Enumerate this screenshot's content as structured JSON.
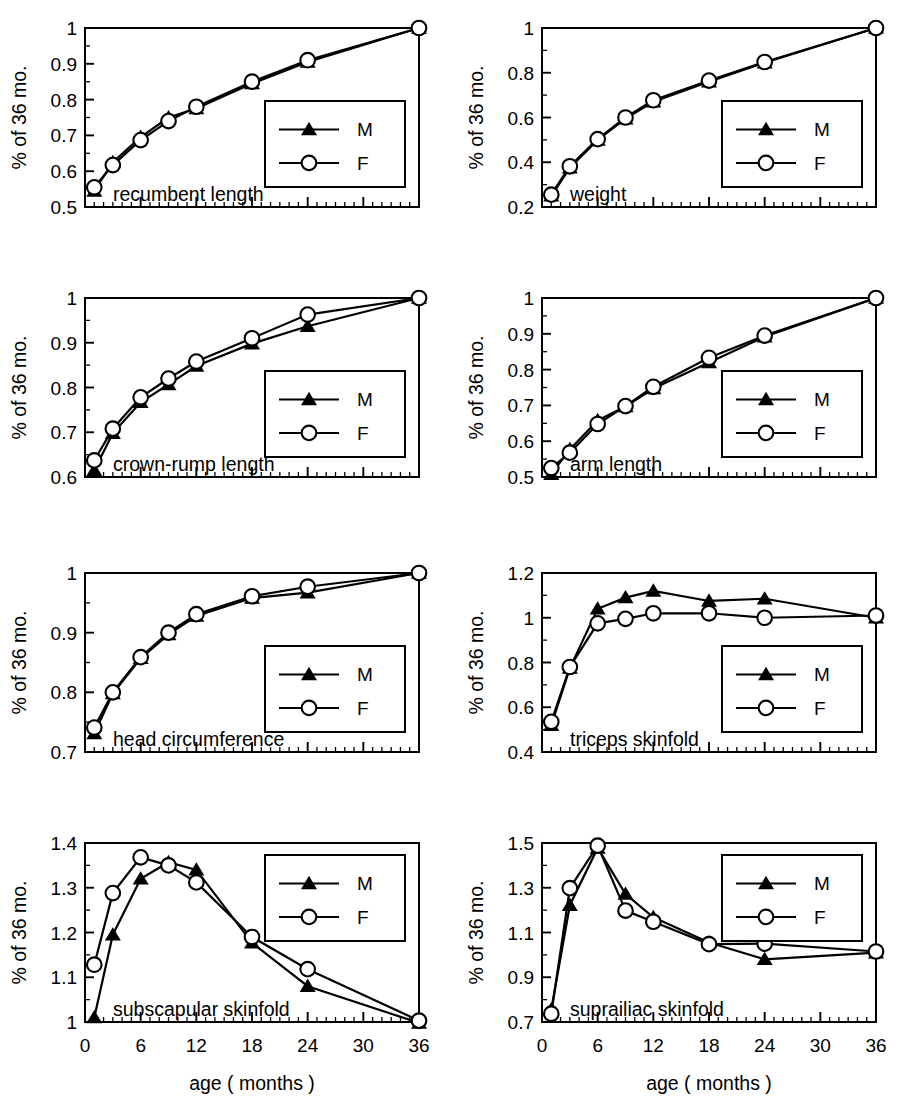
{
  "figure": {
    "axis_titles": {
      "y": "% of 36 mo.",
      "x": "age ( months )"
    },
    "legend": {
      "male_label": "M",
      "female_label": "F",
      "male_marker": "filled-triangle",
      "female_marker": "open-circle"
    },
    "x_tick_labels": [
      "0",
      "6",
      "12",
      "18",
      "24",
      "30",
      "36"
    ],
    "line_color": "#000000"
  },
  "chart_data": [
    {
      "type": "line",
      "title": "recumbent length",
      "xlabel": "age ( months )",
      "ylabel": "% of 36 mo.",
      "x": [
        1,
        3,
        6,
        9,
        12,
        18,
        24,
        36
      ],
      "xlim": [
        0,
        36
      ],
      "ylim": [
        0.5,
        1.0
      ],
      "y_ticks": [
        0.5,
        0.6,
        0.7,
        0.8,
        0.9,
        1.0
      ],
      "y_tick_labels": [
        "0.5",
        "0.6",
        "0.7",
        "0.8",
        "0.9",
        "1"
      ],
      "grid": false,
      "legend_position": "lower-right",
      "series": [
        {
          "name": "M",
          "values": [
            0.545,
            0.625,
            0.695,
            0.75,
            0.775,
            0.845,
            0.905,
            1.0
          ]
        },
        {
          "name": "F",
          "values": [
            0.555,
            0.617,
            0.687,
            0.74,
            0.78,
            0.85,
            0.91,
            1.0
          ]
        }
      ]
    },
    {
      "type": "line",
      "title": "weight",
      "xlabel": "age ( months )",
      "ylabel": "% of 36 mo.",
      "x": [
        1,
        3,
        6,
        9,
        12,
        18,
        24,
        36
      ],
      "xlim": [
        0,
        36
      ],
      "ylim": [
        0.2,
        1.0
      ],
      "y_ticks": [
        0.2,
        0.4,
        0.6,
        0.8,
        1.0
      ],
      "y_tick_labels": [
        "0.2",
        "0.4",
        "0.6",
        "0.8",
        "1"
      ],
      "grid": false,
      "legend_position": "lower-right",
      "series": [
        {
          "name": "M",
          "values": [
            0.25,
            0.375,
            0.5,
            0.595,
            0.67,
            0.76,
            0.845,
            1.0
          ]
        },
        {
          "name": "F",
          "values": [
            0.255,
            0.382,
            0.503,
            0.6,
            0.677,
            0.765,
            0.848,
            1.0
          ]
        }
      ]
    },
    {
      "type": "line",
      "title": "crown-rump length",
      "xlabel": "age ( months )",
      "ylabel": "% of 36 mo.",
      "x": [
        1,
        3,
        6,
        9,
        12,
        18,
        24,
        36
      ],
      "xlim": [
        0,
        36
      ],
      "ylim": [
        0.6,
        1.0
      ],
      "y_ticks": [
        0.6,
        0.7,
        0.8,
        0.9,
        1.0
      ],
      "y_tick_labels": [
        "0.6",
        "0.7",
        "0.8",
        "0.9",
        "1"
      ],
      "grid": false,
      "legend_position": "lower-right",
      "series": [
        {
          "name": "M",
          "values": [
            0.615,
            0.698,
            0.767,
            0.807,
            0.848,
            0.898,
            0.937,
            1.0
          ]
        },
        {
          "name": "F",
          "values": [
            0.637,
            0.708,
            0.778,
            0.82,
            0.858,
            0.91,
            0.963,
            1.0
          ]
        }
      ]
    },
    {
      "type": "line",
      "title": "arm length",
      "xlabel": "age ( months )",
      "ylabel": "% of 36 mo.",
      "x": [
        1,
        3,
        6,
        9,
        12,
        18,
        24,
        36
      ],
      "xlim": [
        0,
        36
      ],
      "ylim": [
        0.5,
        1.0
      ],
      "y_ticks": [
        0.5,
        0.6,
        0.7,
        0.8,
        0.9,
        1.0
      ],
      "y_tick_labels": [
        "0.5",
        "0.6",
        "0.7",
        "0.8",
        "0.9",
        "1"
      ],
      "grid": false,
      "legend_position": "lower-right",
      "series": [
        {
          "name": "M",
          "values": [
            0.508,
            0.577,
            0.658,
            0.697,
            0.747,
            0.82,
            0.892,
            1.0
          ]
        },
        {
          "name": "F",
          "values": [
            0.525,
            0.568,
            0.648,
            0.698,
            0.752,
            0.833,
            0.895,
            1.0
          ]
        }
      ]
    },
    {
      "type": "line",
      "title": "head circumference",
      "xlabel": "age ( months )",
      "ylabel": "% of 36 mo.",
      "x": [
        1,
        3,
        6,
        9,
        12,
        18,
        24,
        36
      ],
      "xlim": [
        0,
        36
      ],
      "ylim": [
        0.7,
        1.0
      ],
      "y_ticks": [
        0.7,
        0.8,
        0.9,
        1.0
      ],
      "y_tick_labels": [
        "0.7",
        "0.8",
        "0.9",
        "1"
      ],
      "grid": false,
      "legend_position": "lower-right",
      "series": [
        {
          "name": "M",
          "values": [
            0.731,
            0.798,
            0.857,
            0.897,
            0.928,
            0.958,
            0.967,
            1.0
          ]
        },
        {
          "name": "F",
          "values": [
            0.741,
            0.8,
            0.859,
            0.9,
            0.931,
            0.961,
            0.977,
            1.0
          ]
        }
      ]
    },
    {
      "type": "line",
      "title": "triceps skinfold",
      "xlabel": "age ( months )",
      "ylabel": "% of 36 mo.",
      "x": [
        1,
        3,
        6,
        9,
        12,
        18,
        24,
        36
      ],
      "xlim": [
        0,
        36
      ],
      "ylim": [
        0.4,
        1.2
      ],
      "y_ticks": [
        0.4,
        0.6,
        0.8,
        1.0,
        1.2
      ],
      "y_tick_labels": [
        "0.4",
        "0.6",
        "0.8",
        "1",
        "1.2"
      ],
      "grid": false,
      "legend_position": "lower-right",
      "series": [
        {
          "name": "M",
          "values": [
            0.52,
            0.775,
            1.04,
            1.09,
            1.12,
            1.075,
            1.085,
            1.0
          ]
        },
        {
          "name": "F",
          "values": [
            0.535,
            0.78,
            0.975,
            0.995,
            1.02,
            1.02,
            1.0,
            1.01
          ]
        }
      ]
    },
    {
      "type": "line",
      "title": "subscapular skinfold",
      "xlabel": "age ( months )",
      "ylabel": "% of 36 mo.",
      "x": [
        1,
        3,
        6,
        9,
        12,
        18,
        24,
        36
      ],
      "xlim": [
        0,
        36
      ],
      "ylim": [
        1.0,
        1.4
      ],
      "y_ticks": [
        1.0,
        1.1,
        1.2,
        1.3,
        1.4
      ],
      "y_tick_labels": [
        "1",
        "1.1",
        "1.2",
        "1.3",
        "1.4"
      ],
      "grid": false,
      "legend_position": "upper-right",
      "series": [
        {
          "name": "M",
          "values": [
            1.01,
            1.195,
            1.32,
            1.357,
            1.34,
            1.177,
            1.08,
            0.998
          ]
        },
        {
          "name": "F",
          "values": [
            1.128,
            1.288,
            1.368,
            1.35,
            1.312,
            1.19,
            1.118,
            1.003
          ]
        }
      ]
    },
    {
      "type": "line",
      "title": "suprailiac skinfold",
      "xlabel": "age ( months )",
      "ylabel": "% of 36 mo.",
      "x": [
        1,
        3,
        6,
        9,
        12,
        18,
        24,
        36
      ],
      "xlim": [
        0,
        36
      ],
      "ylim": [
        0.7,
        1.5
      ],
      "y_ticks": [
        0.7,
        0.9,
        1.1,
        1.3,
        1.5
      ],
      "y_tick_labels": [
        "0.7",
        "0.9",
        "1.1",
        "1.3",
        "1.5"
      ],
      "grid": false,
      "legend_position": "upper-right",
      "series": [
        {
          "name": "M",
          "values": [
            0.755,
            1.222,
            1.478,
            1.272,
            1.168,
            1.055,
            0.98,
            1.01
          ]
        },
        {
          "name": "F",
          "values": [
            0.737,
            1.298,
            1.488,
            1.198,
            1.148,
            1.048,
            1.05,
            1.015
          ]
        }
      ]
    }
  ]
}
